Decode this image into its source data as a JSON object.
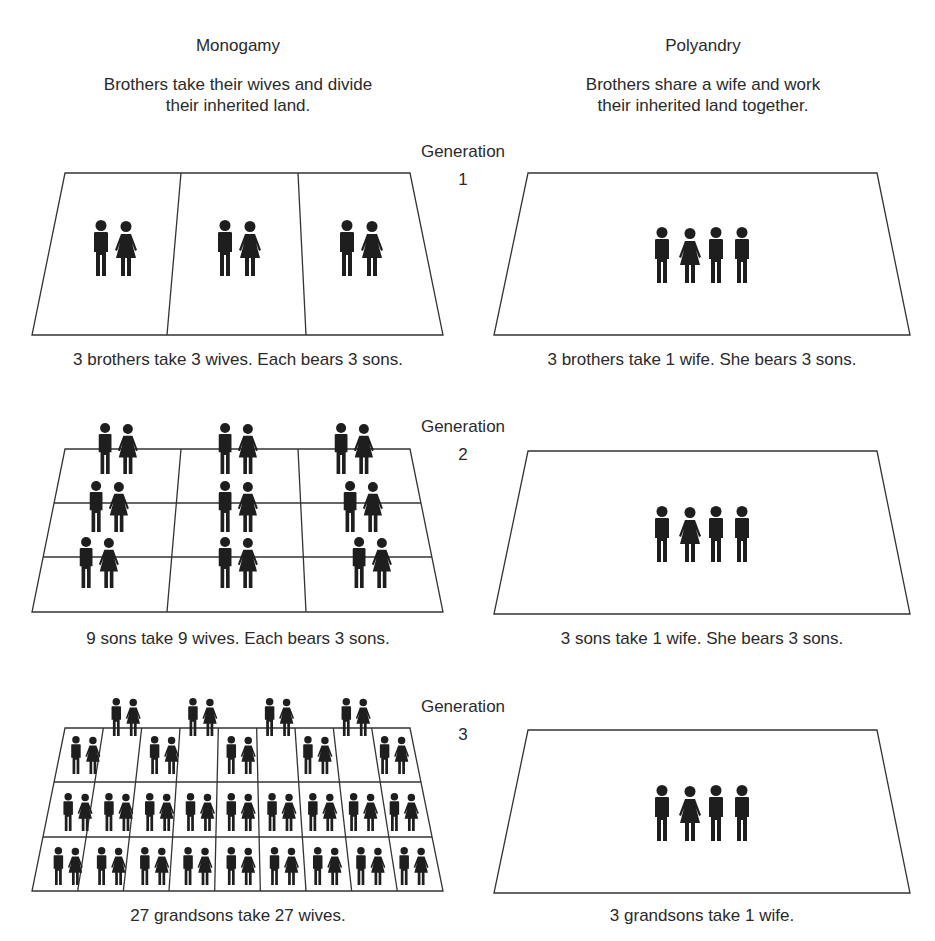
{
  "columns": {
    "monogamy": {
      "title": "Monogamy",
      "description_line1": "Brothers take their wives and divide",
      "description_line2": "their inherited land."
    },
    "polyandry": {
      "title": "Polyandry",
      "description_line1": "Brothers share a wife and work",
      "description_line2": "their inherited land together."
    }
  },
  "generations": [
    {
      "label": "Generation",
      "number": "1",
      "monogamy_caption": "3 brothers take 3 wives. Each bears 3 sons.",
      "polyandry_caption": "3 brothers take 1 wife. She bears 3 sons.",
      "monogamy_couples": 3,
      "polyandry_group": [
        "man",
        "woman",
        "man",
        "man"
      ]
    },
    {
      "label": "Generation",
      "number": "2",
      "monogamy_caption": "9 sons take 9 wives. Each bears 3 sons.",
      "polyandry_caption": "3 sons take 1 wife. She bears 3 sons.",
      "monogamy_couples": 9,
      "polyandry_group": [
        "man",
        "woman",
        "man",
        "man"
      ]
    },
    {
      "label": "Generation",
      "number": "3",
      "monogamy_caption": "27 grandsons take 27 wives.",
      "polyandry_caption": "3 grandsons take 1 wife.",
      "monogamy_couples": 27,
      "polyandry_group": [
        "man",
        "woman",
        "man",
        "man"
      ]
    }
  ],
  "colors": {
    "ink": "#1e1e1e",
    "line": "#333333",
    "text": "#2a2a2a",
    "background": "#ffffff"
  }
}
